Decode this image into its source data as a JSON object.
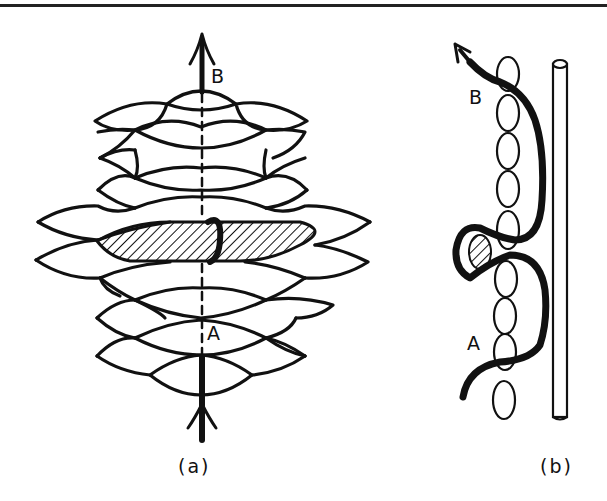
{
  "figure": {
    "panels": [
      {
        "id": "a",
        "caption": "(a)",
        "description": "Hexagonal knitted/netted mesh of lens-shaped cells with a hatched elongated inclusion threaded through the middle rows; a bold arrow path runs vertically from A (bottom) to B (top), dashed where it passes behind the mesh.",
        "labels": {
          "top_point": "B",
          "bottom_point": "A"
        }
      },
      {
        "id": "b",
        "caption": "(b)",
        "description": "Side view: a vertical chain of oval loops beside a cylindrical rod; a bold curved path enters at A, loops around a hatched oval inclusion, and exits with an arrow at B.",
        "labels": {
          "upper_point": "B",
          "lower_point": "A"
        }
      }
    ],
    "colors": {
      "ink": "#111111",
      "background": "#ffffff"
    }
  }
}
